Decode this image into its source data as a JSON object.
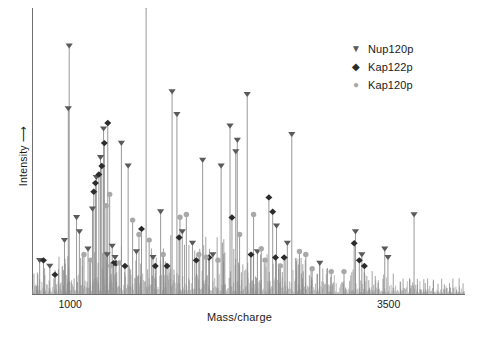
{
  "chart_data": {
    "type": "line",
    "title": "",
    "subtitle": "",
    "xlabel": "Mass/charge",
    "ylabel": "Intensity ⟶",
    "ylabel_text": "Intensity",
    "grid": false,
    "legend_position": "top-right",
    "xlim": [
      700,
      4100
    ],
    "ylim": [
      0,
      100
    ],
    "xticks": [
      1000,
      3500
    ],
    "xtick_labels": [
      "1000",
      "3500"
    ],
    "yticks": [],
    "ytick_labels": [],
    "colors": {
      "spectrum_line": "#8c8c8c",
      "noise": "#9e9e9e",
      "axis": "#6f6f6f",
      "nup120p": "#5a5a5a",
      "kap122p": "#2b2b2b",
      "kap120p": "#a8a8a8",
      "text": "#1a1a1a",
      "background": "#ffffff"
    },
    "legend": [
      {
        "label": "Nup120p",
        "marker": "triangle-down",
        "color": "#5a5a5a"
      },
      {
        "label": "Kap122p",
        "marker": "diamond",
        "color": "#2b2b2b"
      },
      {
        "label": "Kap120p",
        "marker": "circle",
        "color": "#a8a8a8"
      }
    ],
    "series": [
      {
        "name": "Nup120p",
        "marker": "triangle-down",
        "points": [
          {
            "x": 760,
            "y": 11
          },
          {
            "x": 840,
            "y": 9
          },
          {
            "x": 955,
            "y": 18
          },
          {
            "x": 985,
            "y": 64
          },
          {
            "x": 992,
            "y": 86
          },
          {
            "x": 1050,
            "y": 26
          },
          {
            "x": 1072,
            "y": 21
          },
          {
            "x": 1140,
            "y": 15
          },
          {
            "x": 1175,
            "y": 29
          },
          {
            "x": 1205,
            "y": 40
          },
          {
            "x": 1238,
            "y": 47
          },
          {
            "x": 1262,
            "y": 57
          },
          {
            "x": 1290,
            "y": 13
          },
          {
            "x": 1330,
            "y": 16
          },
          {
            "x": 1352,
            "y": 12
          },
          {
            "x": 1402,
            "y": 52
          },
          {
            "x": 1455,
            "y": 44
          },
          {
            "x": 1520,
            "y": 14
          },
          {
            "x": 1596,
            "y": 100
          },
          {
            "x": 1650,
            "y": 12
          },
          {
            "x": 1710,
            "y": 28
          },
          {
            "x": 1800,
            "y": 70
          },
          {
            "x": 1838,
            "y": 62
          },
          {
            "x": 1880,
            "y": 21
          },
          {
            "x": 1960,
            "y": 17
          },
          {
            "x": 2040,
            "y": 46
          },
          {
            "x": 2120,
            "y": 13
          },
          {
            "x": 2185,
            "y": 44
          },
          {
            "x": 2255,
            "y": 58
          },
          {
            "x": 2300,
            "y": 49
          },
          {
            "x": 2312,
            "y": 53
          },
          {
            "x": 2390,
            "y": 69
          },
          {
            "x": 2470,
            "y": 14
          },
          {
            "x": 2620,
            "y": 23
          },
          {
            "x": 2705,
            "y": 17
          },
          {
            "x": 2740,
            "y": 55
          },
          {
            "x": 2960,
            "y": 10
          },
          {
            "x": 3240,
            "y": 21
          },
          {
            "x": 3290,
            "y": 13
          },
          {
            "x": 3470,
            "y": 15
          },
          {
            "x": 3495,
            "y": 12
          },
          {
            "x": 3700,
            "y": 27
          }
        ]
      },
      {
        "name": "Kap122p",
        "marker": "diamond",
        "points": [
          {
            "x": 790,
            "y": 11
          },
          {
            "x": 880,
            "y": 6
          },
          {
            "x": 1185,
            "y": 35
          },
          {
            "x": 1198,
            "y": 38
          },
          {
            "x": 1225,
            "y": 41
          },
          {
            "x": 1248,
            "y": 44
          },
          {
            "x": 1268,
            "y": 52
          },
          {
            "x": 1295,
            "y": 59
          },
          {
            "x": 1340,
            "y": 10
          },
          {
            "x": 1360,
            "y": 10
          },
          {
            "x": 1430,
            "y": 9
          },
          {
            "x": 1560,
            "y": 22
          },
          {
            "x": 1668,
            "y": 9
          },
          {
            "x": 1760,
            "y": 9
          },
          {
            "x": 1855,
            "y": 19
          },
          {
            "x": 1990,
            "y": 11
          },
          {
            "x": 2090,
            "y": 12
          },
          {
            "x": 2270,
            "y": 26
          },
          {
            "x": 2420,
            "y": 13
          },
          {
            "x": 2560,
            "y": 33
          },
          {
            "x": 2590,
            "y": 28
          },
          {
            "x": 2612,
            "y": 12
          },
          {
            "x": 2680,
            "y": 12
          },
          {
            "x": 3230,
            "y": 17
          },
          {
            "x": 3270,
            "y": 11
          },
          {
            "x": 3310,
            "y": 9
          }
        ]
      },
      {
        "name": "Kap120p",
        "marker": "circle",
        "points": [
          {
            "x": 1108,
            "y": 13
          },
          {
            "x": 1160,
            "y": 11
          },
          {
            "x": 1282,
            "y": 30
          },
          {
            "x": 1310,
            "y": 34
          },
          {
            "x": 1318,
            "y": 9
          },
          {
            "x": 1385,
            "y": 10
          },
          {
            "x": 1490,
            "y": 25
          },
          {
            "x": 1540,
            "y": 20
          },
          {
            "x": 1620,
            "y": 18
          },
          {
            "x": 1730,
            "y": 13
          },
          {
            "x": 1862,
            "y": 26
          },
          {
            "x": 1912,
            "y": 27
          },
          {
            "x": 2010,
            "y": 13
          },
          {
            "x": 2068,
            "y": 12
          },
          {
            "x": 2160,
            "y": 11
          },
          {
            "x": 2330,
            "y": 20
          },
          {
            "x": 2440,
            "y": 27
          },
          {
            "x": 2500,
            "y": 15
          },
          {
            "x": 2530,
            "y": 11
          },
          {
            "x": 2650,
            "y": 9
          },
          {
            "x": 2800,
            "y": 14
          },
          {
            "x": 2850,
            "y": 13
          },
          {
            "x": 2900,
            "y": 8
          },
          {
            "x": 3050,
            "y": 7
          },
          {
            "x": 3150,
            "y": 7
          }
        ]
      }
    ]
  },
  "axes": {
    "xlabel": "Mass/charge",
    "ylabel": "Intensity ⟶",
    "xtick_1": "1000",
    "xtick_2": "3500"
  },
  "legend": {
    "items": [
      {
        "label": "Nup120p",
        "glyph": "▼"
      },
      {
        "label": "Kap122p",
        "glyph": "◆"
      },
      {
        "label": "Kap120p",
        "glyph": "●"
      }
    ]
  }
}
